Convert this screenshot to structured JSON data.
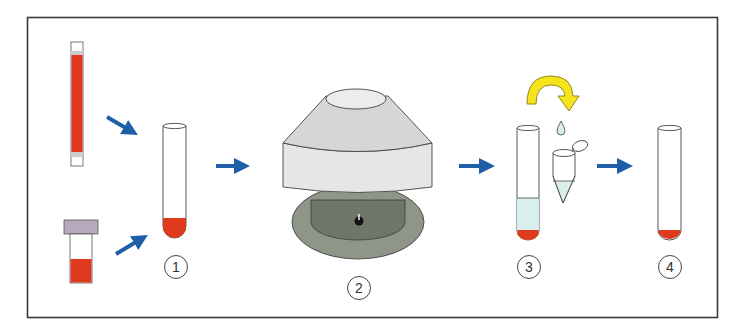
{
  "diagram": {
    "type": "process-flow",
    "colors": {
      "frame": "#3a3a3a",
      "blood": "#e03a1e",
      "arrow": "#1f5fa8",
      "rotate_arrow": "#f5e41c",
      "rotate_arrow_outline": "#8a7a10",
      "liquid": "#d8efec",
      "cap": "#b8a8bc",
      "centrifuge_top": "#e4e4e4",
      "centrifuge_base": "#8f9688",
      "centrifuge_inner": "#6f7668"
    },
    "steps": [
      {
        "id": 1,
        "label": "①",
        "element": "test tube with blood at bottom"
      },
      {
        "id": 2,
        "label": "②",
        "element": "centrifuge"
      },
      {
        "id": 3,
        "label": "③",
        "element": "test tube with supernatant, microtube receiving liquid"
      },
      {
        "id": 4,
        "label": "④",
        "element": "test tube with pellet only"
      }
    ],
    "sources": [
      {
        "name": "capillary-tube",
        "content": "blood"
      },
      {
        "name": "capped-vial",
        "content": "blood"
      }
    ]
  }
}
